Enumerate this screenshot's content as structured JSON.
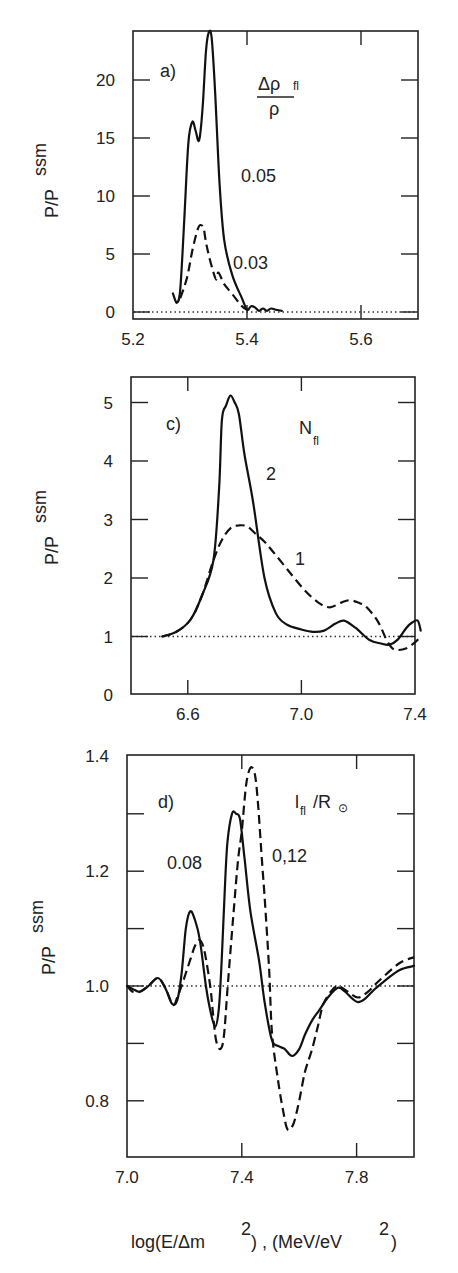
{
  "figure": {
    "xlabel_main": "log(E/Δm",
    "xlabel_sup1": "2",
    "xlabel_mid": ") , (MeV/eV",
    "xlabel_sup2": "2",
    "xlabel_end": ")",
    "ylabel_main": "P/P",
    "ylabel_sup": "ssm"
  },
  "chart_data": [
    {
      "type": "line",
      "panel": "a)",
      "title": "",
      "legend_title": "Δρ fl / ρ",
      "legend_numerator": "Δρ",
      "legend_sub": "fl",
      "legend_denominator": "ρ",
      "xlabel": "log(E/Δm²), (MeV/eV²)",
      "ylabel": "P/P ssm",
      "xlim": [
        5.2,
        5.7
      ],
      "ylim": [
        0,
        24.2
      ],
      "xticks": [
        5.2,
        5.4,
        5.6
      ],
      "xtick_labels": [
        "5.2",
        "5.4",
        "5.6"
      ],
      "yticks": [
        0,
        5,
        10,
        15,
        20
      ],
      "ytick_labels": [
        "0",
        "5",
        "10",
        "15",
        "20"
      ],
      "reference_line": 0,
      "grid": false,
      "series": [
        {
          "name": "0.05",
          "style": "solid",
          "x": [
            5.27,
            5.277,
            5.283,
            5.29,
            5.297,
            5.304,
            5.31,
            5.316,
            5.322,
            5.328,
            5.333,
            5.338,
            5.344,
            5.352,
            5.36,
            5.374,
            5.391,
            5.4,
            5.407,
            5.414,
            5.421,
            5.428,
            5.435,
            5.442,
            5.45,
            5.461
          ],
          "y": [
            1.6,
            0.8,
            2.0,
            8.0,
            14.5,
            16.4,
            15.6,
            14.8,
            17.5,
            22.5,
            24.1,
            23.6,
            19.0,
            11.0,
            6.2,
            3.2,
            1.2,
            0.2,
            0.5,
            0.4,
            0.1,
            0.3,
            0.1,
            0.3,
            0.2,
            0.1
          ]
        },
        {
          "name": "0.03",
          "style": "dashed",
          "x": [
            5.283,
            5.295,
            5.305,
            5.314,
            5.319,
            5.324,
            5.328,
            5.333,
            5.34,
            5.346,
            5.35,
            5.36,
            5.375,
            5.391,
            5.4
          ],
          "y": [
            1.2,
            3.0,
            5.5,
            7.2,
            7.5,
            7.2,
            6.0,
            4.9,
            3.6,
            2.8,
            3.4,
            2.4,
            1.5,
            0.5,
            0.2
          ]
        }
      ],
      "annotations": [
        "0.05",
        "0.03"
      ]
    },
    {
      "type": "line",
      "panel": "c)",
      "title": "",
      "legend_title": "N fl",
      "legend_main": "N",
      "legend_sub": "fl",
      "xlabel": "log(E/Δm²), (MeV/eV²)",
      "ylabel": "P/P ssm",
      "xlim": [
        6.4,
        7.4
      ],
      "ylim": [
        0,
        5.42
      ],
      "xticks": [
        6.6,
        7.0,
        7.4
      ],
      "xtick_labels": [
        "6.6",
        "7.0",
        "7.4"
      ],
      "yticks": [
        0,
        1,
        2,
        3,
        4,
        5
      ],
      "ytick_labels": [
        "0",
        "1",
        "2",
        "3",
        "4",
        "5"
      ],
      "reference_line": 1,
      "grid": false,
      "series": [
        {
          "name": "2",
          "style": "solid",
          "x": [
            6.51,
            6.56,
            6.61,
            6.65,
            6.69,
            6.71,
            6.72,
            6.735,
            6.75,
            6.765,
            6.78,
            6.8,
            6.83,
            6.87,
            6.91,
            6.95,
            7.0,
            7.04,
            7.08,
            7.12,
            7.15,
            7.19,
            7.24,
            7.28,
            7.31,
            7.34,
            7.37,
            7.39,
            7.41,
            7.42
          ],
          "y": [
            1.0,
            1.08,
            1.29,
            1.7,
            2.3,
            3.5,
            4.7,
            4.95,
            5.12,
            5.0,
            4.8,
            4.1,
            3.3,
            2.0,
            1.4,
            1.2,
            1.12,
            1.08,
            1.1,
            1.22,
            1.27,
            1.15,
            0.94,
            0.88,
            0.86,
            0.95,
            1.15,
            1.24,
            1.27,
            1.1
          ]
        },
        {
          "name": "1",
          "style": "dashed",
          "x": [
            6.51,
            6.56,
            6.61,
            6.65,
            6.69,
            6.72,
            6.75,
            6.78,
            6.81,
            6.84,
            6.87,
            6.9,
            6.95,
            7.01,
            7.06,
            7.1,
            7.14,
            7.17,
            7.2,
            7.23,
            7.27,
            7.3,
            7.32,
            7.34,
            7.37,
            7.4,
            7.42
          ],
          "y": [
            1.0,
            1.08,
            1.29,
            1.7,
            2.3,
            2.65,
            2.85,
            2.9,
            2.88,
            2.75,
            2.62,
            2.45,
            2.15,
            1.8,
            1.58,
            1.5,
            1.58,
            1.62,
            1.58,
            1.5,
            1.25,
            0.94,
            0.8,
            0.77,
            0.8,
            0.9,
            1.0
          ]
        }
      ],
      "annotations": [
        "2",
        "1"
      ]
    },
    {
      "type": "line",
      "panel": "d)",
      "title": "",
      "legend_title": "l fl / R⊙",
      "legend_main": "l",
      "legend_sub": "fl",
      "legend_rest": "/R",
      "legend_symbol": "⊙",
      "xlabel": "log(E/Δm²), (MeV/eV²)",
      "ylabel": "P/P ssm",
      "xlim": [
        7.0,
        8.0
      ],
      "ylim": [
        0.7,
        1.4
      ],
      "xticks": [
        7.0,
        7.4,
        7.8
      ],
      "xtick_labels": [
        "7.0",
        "7.4",
        "7.8"
      ],
      "yticks": [
        0.8,
        0.9,
        1.0,
        1.1,
        1.2,
        1.3,
        1.4
      ],
      "ytick_labels": [
        "0.8",
        "",
        "1.0",
        "",
        "1.2",
        "",
        "1.4"
      ],
      "reference_line": 1.0,
      "grid": false,
      "series": [
        {
          "name": "0.08",
          "style": "solid",
          "x": [
            7.0,
            7.02,
            7.045,
            7.075,
            7.108,
            7.135,
            7.157,
            7.175,
            7.19,
            7.205,
            7.22,
            7.237,
            7.254,
            7.275,
            7.29,
            7.307,
            7.32,
            7.33,
            7.34,
            7.35,
            7.366,
            7.38,
            7.394,
            7.41,
            7.43,
            7.46,
            7.48,
            7.505,
            7.53,
            7.55,
            7.575,
            7.6,
            7.62,
            7.645,
            7.67,
            7.7,
            7.735,
            7.76,
            7.785,
            7.805,
            7.83,
            7.86,
            7.9,
            7.95,
            8.0
          ],
          "y": [
            1.0,
            0.995,
            0.99,
            1.0,
            1.014,
            0.995,
            0.969,
            0.975,
            1.02,
            1.1,
            1.13,
            1.115,
            1.08,
            1.0,
            0.958,
            0.929,
            0.96,
            1.045,
            1.16,
            1.25,
            1.3,
            1.3,
            1.29,
            1.22,
            1.13,
            1.045,
            0.97,
            0.906,
            0.895,
            0.89,
            0.878,
            0.89,
            0.915,
            0.94,
            0.958,
            0.98,
            0.997,
            0.99,
            0.978,
            0.972,
            0.978,
            0.993,
            1.01,
            1.028,
            1.035
          ]
        },
        {
          "name": "0,12",
          "style": "dashed",
          "x": [
            7.0,
            7.02,
            7.045,
            7.075,
            7.108,
            7.135,
            7.16,
            7.175,
            7.19,
            7.22,
            7.237,
            7.254,
            7.27,
            7.29,
            7.3,
            7.31,
            7.324,
            7.337,
            7.35,
            7.37,
            7.387,
            7.4,
            7.415,
            7.43,
            7.445,
            7.456,
            7.47,
            7.48,
            7.495,
            7.505,
            7.526,
            7.545,
            7.56,
            7.58,
            7.6,
            7.62,
            7.645,
            7.665,
            7.683,
            7.71,
            7.735,
            7.77,
            7.805,
            7.84,
            7.88,
            7.95,
            8.0
          ],
          "y": [
            1.0,
            0.99,
            0.99,
            1.0,
            1.014,
            0.995,
            0.967,
            0.98,
            1.0,
            1.045,
            1.07,
            1.08,
            1.06,
            1.0,
            0.95,
            0.906,
            0.89,
            0.91,
            0.993,
            1.12,
            1.22,
            1.27,
            1.35,
            1.38,
            1.37,
            1.32,
            1.22,
            1.15,
            1.03,
            0.92,
            0.836,
            0.78,
            0.75,
            0.76,
            0.8,
            0.85,
            0.89,
            0.93,
            0.967,
            0.99,
            1.0,
            0.99,
            0.98,
            0.99,
            1.01,
            1.04,
            1.05
          ]
        }
      ],
      "annotations": [
        "0.08",
        "0,12"
      ]
    }
  ]
}
